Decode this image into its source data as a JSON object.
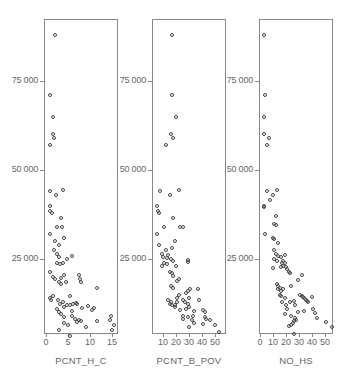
{
  "chart_data": [
    {
      "type": "scatter",
      "title": "",
      "xlabel": "PCNT_H_C",
      "ylabel": "",
      "xticks": [
        0,
        5,
        10,
        15
      ],
      "yticks": [
        25000,
        50000,
        75000
      ],
      "ytick_labels": [
        "25 000",
        "50 000",
        "75 000"
      ],
      "xlim": [
        -0.5,
        16
      ],
      "ylim": [
        0,
        92000
      ],
      "grid": false,
      "points": [
        [
          2.0,
          88000
        ],
        [
          1.0,
          71000
        ],
        [
          1.5,
          65000
        ],
        [
          1.5,
          60000
        ],
        [
          1.7,
          59000
        ],
        [
          0.8,
          57000
        ],
        [
          1.0,
          44000
        ],
        [
          2.3,
          43000
        ],
        [
          3.8,
          44500
        ],
        [
          1.0,
          40000
        ],
        [
          0.9,
          38500
        ],
        [
          1.3,
          38000
        ],
        [
          3.5,
          36500
        ],
        [
          2.5,
          34000
        ],
        [
          3.7,
          34000
        ],
        [
          1.0,
          32000
        ],
        [
          2.0,
          30000
        ],
        [
          3.0,
          29000
        ],
        [
          4.0,
          31000
        ],
        [
          1.7,
          27500
        ],
        [
          2.5,
          26500
        ],
        [
          3.0,
          25500
        ],
        [
          4.8,
          25000
        ],
        [
          6.0,
          25800
        ],
        [
          2.5,
          24000
        ],
        [
          3.2,
          23500
        ],
        [
          3.8,
          23800
        ],
        [
          0.8,
          21500
        ],
        [
          1.5,
          20000
        ],
        [
          2.0,
          19500
        ],
        [
          3.5,
          19800
        ],
        [
          4.0,
          20500
        ],
        [
          3.0,
          18500
        ],
        [
          3.5,
          18000
        ],
        [
          4.5,
          18500
        ],
        [
          7.5,
          20500
        ],
        [
          7.8,
          19500
        ],
        [
          8.0,
          18500
        ],
        [
          11.5,
          17000
        ],
        [
          1.0,
          14000
        ],
        [
          1.5,
          14500
        ],
        [
          1.2,
          13500
        ],
        [
          2.8,
          13500
        ],
        [
          3.2,
          12500
        ],
        [
          3.8,
          13000
        ],
        [
          5.5,
          14500
        ],
        [
          2.5,
          11000
        ],
        [
          3.0,
          10200
        ],
        [
          4.0,
          11500
        ],
        [
          4.8,
          12200
        ],
        [
          5.5,
          12000
        ],
        [
          6.2,
          12300
        ],
        [
          6.8,
          12700
        ],
        [
          7.0,
          12400
        ],
        [
          8.2,
          11300
        ],
        [
          9.5,
          11700
        ],
        [
          10.5,
          10800
        ],
        [
          11.0,
          11200
        ],
        [
          3.5,
          9500
        ],
        [
          4.0,
          8700
        ],
        [
          6.0,
          10300
        ],
        [
          5.8,
          9000
        ],
        [
          6.5,
          8300
        ],
        [
          7.5,
          7800
        ],
        [
          8.0,
          7500
        ],
        [
          4.0,
          7000
        ],
        [
          5.0,
          6500
        ],
        [
          9.0,
          5800
        ],
        [
          7.0,
          7200
        ],
        [
          11.5,
          7500
        ],
        [
          14.5,
          8000
        ],
        [
          14.8,
          9000
        ],
        [
          15.5,
          6500
        ],
        [
          3.0,
          5000
        ],
        [
          5.5,
          3500
        ],
        [
          15.0,
          5000
        ]
      ]
    },
    {
      "type": "scatter",
      "title": "",
      "xlabel": "PCNT_B_POV",
      "ylabel": "",
      "xticks": [
        10,
        20,
        30,
        40,
        50
      ],
      "yticks": [
        25000,
        50000,
        75000
      ],
      "ytick_labels": [
        "25 000",
        "50 000",
        "75 000"
      ],
      "xlim": [
        0,
        58
      ],
      "ylim": [
        0,
        92000
      ],
      "grid": false,
      "points": [
        [
          17,
          88000
        ],
        [
          17,
          71000
        ],
        [
          20,
          65000
        ],
        [
          16,
          60000
        ],
        [
          18,
          59000
        ],
        [
          12,
          57000
        ],
        [
          8,
          44000
        ],
        [
          15,
          43000
        ],
        [
          22,
          44500
        ],
        [
          5,
          40000
        ],
        [
          6,
          38500
        ],
        [
          7,
          38000
        ],
        [
          18,
          36500
        ],
        [
          11,
          34000
        ],
        [
          23,
          34000
        ],
        [
          25,
          34000
        ],
        [
          5,
          32000
        ],
        [
          19,
          30000
        ],
        [
          7,
          29000
        ],
        [
          17,
          28000
        ],
        [
          12,
          27500
        ],
        [
          9,
          26500
        ],
        [
          14,
          26000
        ],
        [
          10,
          25500
        ],
        [
          13,
          25200
        ],
        [
          16,
          25000
        ],
        [
          18,
          24500
        ],
        [
          11,
          24000
        ],
        [
          13,
          23500
        ],
        [
          9,
          23000
        ],
        [
          29,
          24800
        ],
        [
          29,
          24200
        ],
        [
          20,
          23000
        ],
        [
          15,
          21500
        ],
        [
          17,
          21000
        ],
        [
          18,
          20200
        ],
        [
          22,
          19500
        ],
        [
          21,
          18800
        ],
        [
          16,
          17500
        ],
        [
          18,
          17000
        ],
        [
          29,
          16000
        ],
        [
          28,
          15500
        ],
        [
          31,
          16500
        ],
        [
          37,
          16500
        ],
        [
          22,
          15000
        ],
        [
          21,
          14000
        ],
        [
          30,
          14000
        ],
        [
          38,
          13500
        ],
        [
          14,
          13500
        ],
        [
          16,
          12800
        ],
        [
          19,
          12200
        ],
        [
          21,
          13000
        ],
        [
          25,
          13500
        ],
        [
          27,
          13000
        ],
        [
          29,
          12500
        ],
        [
          30,
          11500
        ],
        [
          15,
          12500
        ],
        [
          17,
          12000
        ],
        [
          19,
          11600
        ],
        [
          23,
          10800
        ],
        [
          28,
          11000
        ],
        [
          34,
          10500
        ],
        [
          41,
          10800
        ],
        [
          42,
          10200
        ],
        [
          33,
          9000
        ],
        [
          25,
          9000
        ],
        [
          25,
          8300
        ],
        [
          29,
          8600
        ],
        [
          32,
          8000
        ],
        [
          42,
          8800
        ],
        [
          43,
          8200
        ],
        [
          46,
          7800
        ],
        [
          34,
          7000
        ],
        [
          41,
          6800
        ],
        [
          50,
          6500
        ],
        [
          30,
          6000
        ],
        [
          53,
          4500
        ]
      ]
    },
    {
      "type": "scatter",
      "title": "",
      "xlabel": "NO_HS",
      "ylabel": "",
      "xticks": [
        0,
        10,
        20,
        30,
        40,
        50
      ],
      "yticks": [
        25000,
        50000,
        75000
      ],
      "ytick_labels": [
        "25 000",
        "50 000",
        "75 000"
      ],
      "xlim": [
        -1,
        56
      ],
      "ylim": [
        0,
        92000
      ],
      "grid": false,
      "points": [
        [
          3,
          88000
        ],
        [
          4,
          71000
        ],
        [
          3,
          65000
        ],
        [
          3,
          60000
        ],
        [
          7,
          59000
        ],
        [
          5,
          57000
        ],
        [
          5,
          44000
        ],
        [
          10,
          43000
        ],
        [
          13,
          44500
        ],
        [
          8,
          41500
        ],
        [
          3,
          40000
        ],
        [
          3,
          39500
        ],
        [
          12,
          37000
        ],
        [
          11,
          34800
        ],
        [
          12,
          34500
        ],
        [
          4,
          32000
        ],
        [
          10,
          31000
        ],
        [
          11,
          30500
        ],
        [
          14,
          29500
        ],
        [
          11,
          27500
        ],
        [
          12,
          26500
        ],
        [
          14,
          25800
        ],
        [
          16,
          25500
        ],
        [
          19,
          26000
        ],
        [
          11,
          25000
        ],
        [
          13,
          24500
        ],
        [
          17,
          24000
        ],
        [
          18,
          24500
        ],
        [
          19,
          23800
        ],
        [
          18,
          23000
        ],
        [
          10,
          22500
        ],
        [
          16,
          22800
        ],
        [
          20,
          22800
        ],
        [
          21,
          22300
        ],
        [
          22,
          21500
        ],
        [
          23,
          21000
        ],
        [
          32,
          20500
        ],
        [
          29,
          19000
        ],
        [
          13,
          18000
        ],
        [
          14,
          17500
        ],
        [
          15,
          17000
        ],
        [
          14,
          16500
        ],
        [
          16,
          16000
        ],
        [
          18,
          16500
        ],
        [
          24,
          17500
        ],
        [
          15,
          15000
        ],
        [
          16,
          14500
        ],
        [
          19,
          14000
        ],
        [
          31,
          14800
        ],
        [
          32,
          14500
        ],
        [
          33,
          14300
        ],
        [
          34,
          14000
        ],
        [
          35,
          13500
        ],
        [
          36,
          13200
        ],
        [
          37,
          13000
        ],
        [
          40,
          14200
        ],
        [
          17,
          13000
        ],
        [
          23,
          12800
        ],
        [
          26,
          13200
        ],
        [
          20,
          12000
        ],
        [
          27,
          12000
        ],
        [
          21,
          11000
        ],
        [
          34,
          10500
        ],
        [
          29,
          10000
        ],
        [
          41,
          11000
        ],
        [
          42,
          9800
        ],
        [
          19,
          9500
        ],
        [
          24,
          9000
        ],
        [
          27,
          8500
        ],
        [
          28,
          8000
        ],
        [
          44,
          8500
        ],
        [
          26,
          7500
        ],
        [
          25,
          7000
        ],
        [
          24,
          6500
        ],
        [
          22,
          6300
        ],
        [
          51,
          7200
        ],
        [
          55,
          5800
        ],
        [
          26,
          4000
        ]
      ]
    }
  ],
  "panels": [
    {
      "x_title": "PCNT_H_C",
      "x_ticks": [
        {
          "v": 0,
          "label": "0"
        },
        {
          "v": 5,
          "label": "5"
        },
        {
          "v": 10,
          "label": "10"
        },
        {
          "v": 15,
          "label": "15"
        }
      ],
      "y_ticks": [
        {
          "v": 75000,
          "label": "75 000"
        },
        {
          "v": 50000,
          "label": "50 000"
        },
        {
          "v": 25000,
          "label": "25 000"
        }
      ]
    },
    {
      "x_title": "PCNT_B_POV",
      "x_ticks": [
        {
          "v": 10,
          "label": "10"
        },
        {
          "v": 20,
          "label": "20"
        },
        {
          "v": 30,
          "label": "30"
        },
        {
          "v": 40,
          "label": "40"
        },
        {
          "v": 50,
          "label": "50"
        }
      ],
      "y_ticks": [
        {
          "v": 75000,
          "label": "75 000"
        },
        {
          "v": 50000,
          "label": "50 000"
        },
        {
          "v": 25000,
          "label": "25 000"
        }
      ]
    },
    {
      "x_title": "NO_HS",
      "x_ticks": [
        {
          "v": 0,
          "label": "0"
        },
        {
          "v": 10,
          "label": "10"
        },
        {
          "v": 20,
          "label": "20"
        },
        {
          "v": 30,
          "label": "30"
        },
        {
          "v": 40,
          "label": "40"
        },
        {
          "v": 50,
          "label": "50"
        }
      ],
      "y_ticks": [
        {
          "v": 75000,
          "label": "75 000"
        },
        {
          "v": 50000,
          "label": "50 000"
        },
        {
          "v": 25000,
          "label": "25 000"
        }
      ]
    }
  ]
}
